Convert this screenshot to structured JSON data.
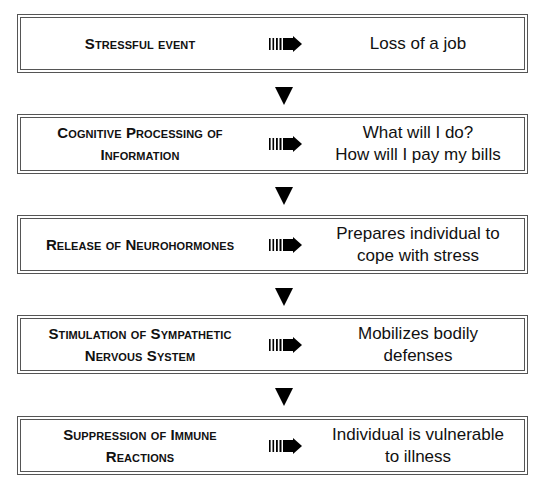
{
  "diagram": {
    "type": "vertical flowchart",
    "stages": [
      {
        "label_lines": [
          "Stressful event"
        ],
        "effect_lines": [
          "Loss of a job"
        ]
      },
      {
        "label_lines": [
          "Cognitive Processing of",
          "Information"
        ],
        "effect_lines": [
          "What will I do?",
          "How will I pay my bills"
        ]
      },
      {
        "label_lines": [
          "Release of Neurohormones"
        ],
        "effect_lines": [
          "Prepares individual to",
          "cope with stress"
        ]
      },
      {
        "label_lines": [
          "Stimulation of Sympathetic",
          "Nervous System"
        ],
        "effect_lines": [
          "Mobilizes bodily",
          "defenses"
        ]
      },
      {
        "label_lines": [
          "Suppression of Immune",
          "Reactions"
        ],
        "effect_lines": [
          "Individual is vulnerable",
          "to illness"
        ]
      }
    ],
    "connector_icon": "striped-right-arrow-icon",
    "flow_icon": "down-triangle-icon",
    "colors": {
      "border": "#555555",
      "text": "#111111",
      "arrow": "#000000",
      "background": "#ffffff"
    }
  }
}
